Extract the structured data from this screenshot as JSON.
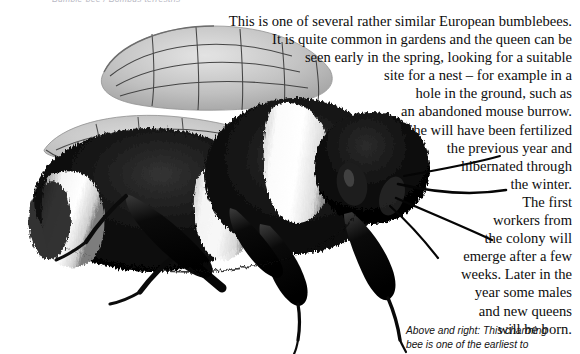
{
  "page": {
    "width": 580,
    "height": 354,
    "background_color": "#ffffff",
    "ink_color": "#0d0d0d"
  },
  "clipped_header": {
    "text": "Bumble-bee / Bombus terrestris"
  },
  "body_copy": {
    "alignment": "right",
    "lines": [
      "This is one of several rather similar European bumblebees.",
      "It is quite common in gardens and the queen can be",
      "seen early in the spring, looking for a suitable",
      "site for a nest – for example in a",
      "hole in the ground, such as",
      "an abandoned mouse burrow.",
      "She will have been fertilized",
      "the previous year and",
      "hibernated through",
      "the winter.",
      "The first",
      "workers from",
      "the colony will",
      "emerge after a few",
      "weeks. Later in the",
      "year some males",
      "and new queens",
      "will be born."
    ]
  },
  "caption": {
    "lines": [
      "Above and right: This charming",
      "bee is one of the earliest to"
    ]
  },
  "illustration": {
    "subject": "bumblebee",
    "style": "grayscale airbrush illustration",
    "orientation": "facing right",
    "parts": [
      "upper-wing",
      "lower-wing",
      "thorax",
      "abdomen",
      "white-abdominal-band",
      "white-collar-band",
      "head",
      "eye",
      "antenna",
      "foreleg",
      "midleg",
      "hindleg"
    ],
    "colors": {
      "fur_dark": "#060606",
      "fur_mid": "#2e2e2e",
      "fur_light": "#f2f2f2",
      "wing_membrane": "#b6b6b6",
      "wing_vein": "#4a4a4a",
      "leg_black": "#080808"
    }
  }
}
